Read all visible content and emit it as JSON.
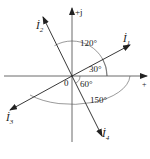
{
  "diagram": {
    "axes": {
      "imag_label": "+j",
      "real_label": "+",
      "origin_label": "0"
    },
    "phasors": [
      {
        "name": "I1",
        "label": "İ",
        "subscript": "1",
        "angle_deg": 30
      },
      {
        "name": "I2",
        "label": "İ",
        "subscript": "2",
        "angle_deg": 120
      },
      {
        "name": "I3",
        "label": "İ",
        "subscript": "3",
        "angle_deg": -150
      },
      {
        "name": "I4",
        "label": "İ",
        "subscript": "4",
        "angle_deg": -60
      }
    ],
    "angle_labels": {
      "a30": "30°",
      "a120": "120°",
      "a60": "60°",
      "a150": "150°"
    },
    "caption": ""
  }
}
